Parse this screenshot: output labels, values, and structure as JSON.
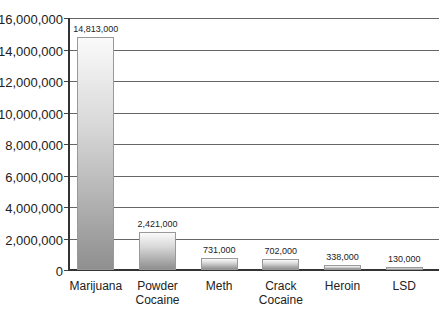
{
  "chart_data": {
    "type": "bar",
    "title": "",
    "xlabel": "",
    "ylabel": "",
    "ylim": [
      0,
      16000000
    ],
    "yticks": [
      0,
      2000000,
      4000000,
      6000000,
      8000000,
      10000000,
      12000000,
      14000000,
      16000000
    ],
    "ytick_labels": [
      "0",
      "2,000,000",
      "4,000,000",
      "6,000,000",
      "8,000,000",
      "10,000,000",
      "12,000,000",
      "14,000,000",
      "16,000,000"
    ],
    "grid": true,
    "legend": "none",
    "categories": [
      "Marijuana",
      "Powder Cocaine",
      "Meth",
      "Crack Cocaine",
      "Heroin",
      "LSD"
    ],
    "category_lines": [
      [
        "Marijuana"
      ],
      [
        "Powder",
        "Cocaine"
      ],
      [
        "Meth"
      ],
      [
        "Crack",
        "Cocaine"
      ],
      [
        "Heroin"
      ],
      [
        "LSD"
      ]
    ],
    "values": [
      14813000,
      2421000,
      731000,
      702000,
      338000,
      130000
    ],
    "value_labels": [
      "14,813,000",
      "2,421,000",
      "731,000",
      "702,000",
      "338,000",
      "130,000"
    ]
  }
}
